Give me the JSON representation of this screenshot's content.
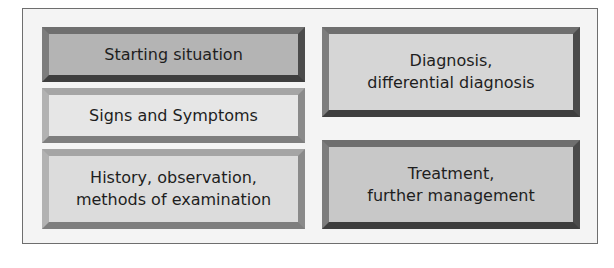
{
  "diagram": {
    "boxes": [
      {
        "id": "starting-situation",
        "lines": [
          "Starting situation"
        ],
        "fill": "#b4b4b4"
      },
      {
        "id": "signs-and-symptoms",
        "lines": [
          "Signs and Symptoms"
        ],
        "fill": "#e6e6e6"
      },
      {
        "id": "history-observation",
        "lines": [
          "History, observation,",
          "methods of examination"
        ],
        "fill": "#dcdcdc"
      },
      {
        "id": "diagnosis",
        "lines": [
          "Diagnosis,",
          "differential diagnosis"
        ],
        "fill": "#d6d6d6"
      },
      {
        "id": "treatment",
        "lines": [
          "Treatment,",
          "further management"
        ],
        "fill": "#c8c8c8"
      }
    ]
  }
}
